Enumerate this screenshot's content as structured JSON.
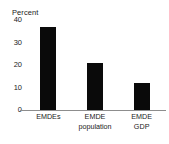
{
  "chart_data": {
    "type": "bar",
    "title": "",
    "ylabel": "Percent",
    "xlabel": "",
    "categories": [
      "EMDEs",
      "EMDE population",
      "EMDE GDP"
    ],
    "category_lines": [
      [
        "EMDEs"
      ],
      [
        "EMDE",
        "population"
      ],
      [
        "EMDE",
        "GDP"
      ]
    ],
    "values": [
      37,
      21,
      12
    ],
    "ylim": [
      0,
      40
    ],
    "yticks": [
      0,
      10,
      20,
      30,
      40
    ],
    "ytick_labels": [
      "0",
      "10",
      "20",
      "30",
      "40"
    ],
    "grid": false,
    "legend": false,
    "bar_color": "#0a0a0a",
    "axis_color": "#8d8d8d",
    "background_color": "#ffffff",
    "text_color": "#1b1b1b"
  }
}
